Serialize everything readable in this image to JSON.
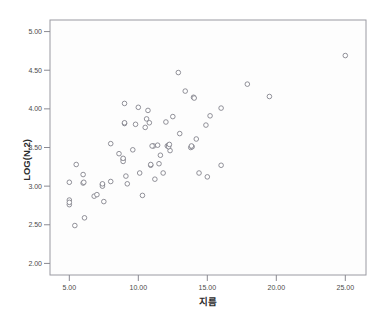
{
  "chart_data": {
    "type": "scatter",
    "title": "",
    "xlabel": "지름",
    "ylabel": "LOG(N.2)",
    "xlim": [
      3.6,
      26.5
    ],
    "ylim": [
      1.85,
      5.15
    ],
    "xticks": [
      "5.00",
      "10.00",
      "15.00",
      "20.00",
      "25.00"
    ],
    "xtick_values": [
      5,
      10,
      15,
      20,
      25
    ],
    "yticks": [
      "5.00",
      "4.50",
      "4.00",
      "3.50",
      "3.00",
      "2.50",
      "2.00"
    ],
    "ytick_values": [
      5.0,
      4.5,
      4.0,
      3.5,
      3.0,
      2.5,
      2.0
    ],
    "grid": false,
    "legend": "none",
    "marker": "open-circle",
    "marker_color": "#7d7d87",
    "point_count": 70,
    "points": [
      [
        5.0,
        3.05
      ],
      [
        5.0,
        2.82
      ],
      [
        5.0,
        2.76
      ],
      [
        5.4,
        2.49
      ],
      [
        5.5,
        3.28
      ],
      [
        6.0,
        3.15
      ],
      [
        6.0,
        3.04
      ],
      [
        6.1,
        2.59
      ],
      [
        6.8,
        2.87
      ],
      [
        7.0,
        2.89
      ],
      [
        7.4,
        3.02
      ],
      [
        7.4,
        3.0
      ],
      [
        7.5,
        2.8
      ],
      [
        8.0,
        3.06
      ],
      [
        8.0,
        3.55
      ],
      [
        8.6,
        3.42
      ],
      [
        8.9,
        3.35
      ],
      [
        8.9,
        3.32
      ],
      [
        9.0,
        4.07
      ],
      [
        9.0,
        3.81
      ],
      [
        9.1,
        3.13
      ],
      [
        9.2,
        3.03
      ],
      [
        9.6,
        3.47
      ],
      [
        9.8,
        3.8
      ],
      [
        10.0,
        4.02
      ],
      [
        10.1,
        3.17
      ],
      [
        10.3,
        2.88
      ],
      [
        10.5,
        3.76
      ],
      [
        10.6,
        3.87
      ],
      [
        10.7,
        3.98
      ],
      [
        10.8,
        3.82
      ],
      [
        10.9,
        3.27
      ],
      [
        11.1,
        3.52
      ],
      [
        11.2,
        3.09
      ],
      [
        11.4,
        3.53
      ],
      [
        11.5,
        3.29
      ],
      [
        11.6,
        3.4
      ],
      [
        11.8,
        3.17
      ],
      [
        12.0,
        3.83
      ],
      [
        12.1,
        3.52
      ],
      [
        12.2,
        3.53
      ],
      [
        12.3,
        3.46
      ],
      [
        12.5,
        3.9
      ],
      [
        12.9,
        4.47
      ],
      [
        13.0,
        3.68
      ],
      [
        13.4,
        4.23
      ],
      [
        13.8,
        3.5
      ],
      [
        13.9,
        3.51
      ],
      [
        14.0,
        4.15
      ],
      [
        14.2,
        3.61
      ],
      [
        14.4,
        3.17
      ],
      [
        14.9,
        3.79
      ],
      [
        15.0,
        3.12
      ],
      [
        15.2,
        3.91
      ],
      [
        16.0,
        4.01
      ],
      [
        16.0,
        3.27
      ],
      [
        17.9,
        4.32
      ],
      [
        19.5,
        4.16
      ],
      [
        25.0,
        4.69
      ],
      [
        8.9,
        3.36
      ],
      [
        9.0,
        3.82
      ],
      [
        12.2,
        3.51
      ],
      [
        13.85,
        3.52
      ],
      [
        5.0,
        2.79
      ],
      [
        7.4,
        3.03
      ],
      [
        11.0,
        3.52
      ],
      [
        12.25,
        3.54
      ],
      [
        10.9,
        3.28
      ],
      [
        6.05,
        3.05
      ],
      [
        14.05,
        4.14
      ]
    ]
  },
  "axes": {
    "x_axis_name": "지름",
    "y_axis_name": "LOG(N.2)"
  }
}
